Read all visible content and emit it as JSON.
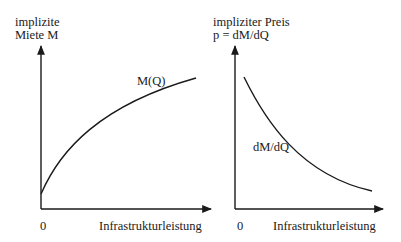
{
  "left_panel": {
    "y_label_line1": "implizite",
    "y_label_line2": "Miete M",
    "curve_label": "M(Q)",
    "origin_label": "0",
    "x_label": "Infrastrukturleistung"
  },
  "right_panel": {
    "y_label_line1": "impliziter Preis",
    "y_label_line2": "p = dM/dQ",
    "curve_label": "dM/dQ",
    "origin_label": "0",
    "x_label": "Infrastrukturleistung"
  },
  "colors": {
    "ink": "#1a1a1a",
    "background": "#ffffff"
  }
}
